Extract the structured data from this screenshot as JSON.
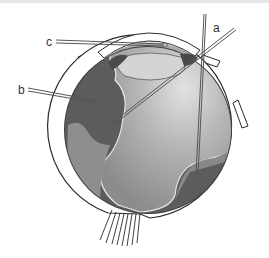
{
  "diagram": {
    "labels": [
      {
        "id": "a",
        "text": "a"
      },
      {
        "id": "b",
        "text": "b"
      },
      {
        "id": "c",
        "text": "c"
      }
    ],
    "colors": {
      "sclera": "#ffffff",
      "outline": "#2a2a2a",
      "choroid": "#4a4a4a",
      "dark_region": "#5c5c5c",
      "vitreous_mid": "#9a9a9a",
      "vitreous_light": "#d8d8d8",
      "lens": "#d2d2d2",
      "retina_line": "#e8e8e8"
    }
  }
}
